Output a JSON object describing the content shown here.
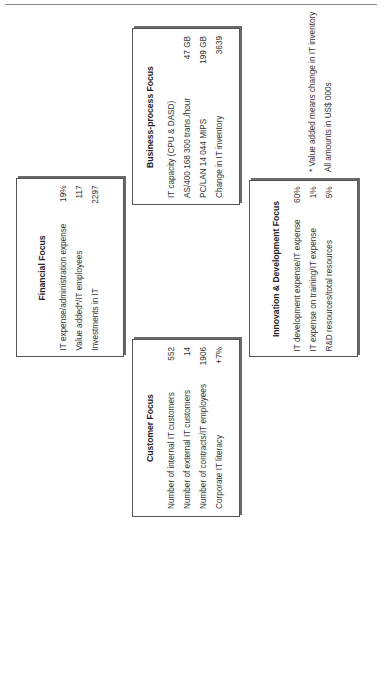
{
  "boxes": {
    "financial": {
      "title": "Financial Focus",
      "rows": [
        {
          "label": "IT expense/administration expense",
          "value": "19%"
        },
        {
          "label": "Value added*/IT employees",
          "value": "117"
        },
        {
          "label": "Investments in IT",
          "value": "2297"
        }
      ]
    },
    "business": {
      "title": "Business-process Focus",
      "rows": [
        {
          "label": "IT capacity (CPU & DASD)",
          "value": ""
        },
        {
          "label": "AS/400 168 300 trans./hour",
          "value": "47 GB"
        },
        {
          "label": "PC/LAN 14 044 MIPS",
          "value": "199 GB"
        },
        {
          "label": "Change in IT inventory",
          "value": "3639"
        }
      ]
    },
    "customer": {
      "title": "Customer Focus",
      "rows": [
        {
          "label": "Number of internal IT customers",
          "value": "552"
        },
        {
          "label": "Number of external IT customers",
          "value": "14"
        },
        {
          "label": "Number of contracts/IT employees",
          "value": "1906"
        },
        {
          "label": "Corporate IT literacy",
          "value": "+7%"
        }
      ]
    },
    "innovation": {
      "title": "Innovation & Development Focus",
      "rows": [
        {
          "label": "IT development expense/IT expense",
          "value": "60%"
        },
        {
          "label": "IT expense on training/IT expense",
          "value": "1%"
        },
        {
          "label": "R&D resources/total resources",
          "value": "5%"
        }
      ]
    }
  },
  "footnotes": {
    "line1": "* Value added means change in IT inventory",
    "line2": "All amounts in US$ 000s"
  }
}
